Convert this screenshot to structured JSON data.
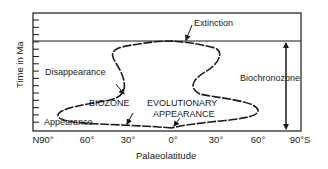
{
  "diagram": {
    "y_axis_title": "Time in Ma",
    "x_axis_title": "Palaeolatitude",
    "x_ticks": [
      "N90°",
      "60°",
      "30°",
      "0°",
      "30°",
      "60°",
      "90°S"
    ],
    "labels": {
      "extinction": "Extinction",
      "disappearance": "Disappearance",
      "appearance": "Appearance",
      "biozone": "BIOZONE",
      "evolutionary_line1": "EVOLUTIONARY",
      "evolutionary_line2": "APPEARANCE",
      "biochronozone": "Biochronozone"
    },
    "colors": {
      "ink": "#1a1a1a",
      "background": "#ffffff"
    }
  }
}
